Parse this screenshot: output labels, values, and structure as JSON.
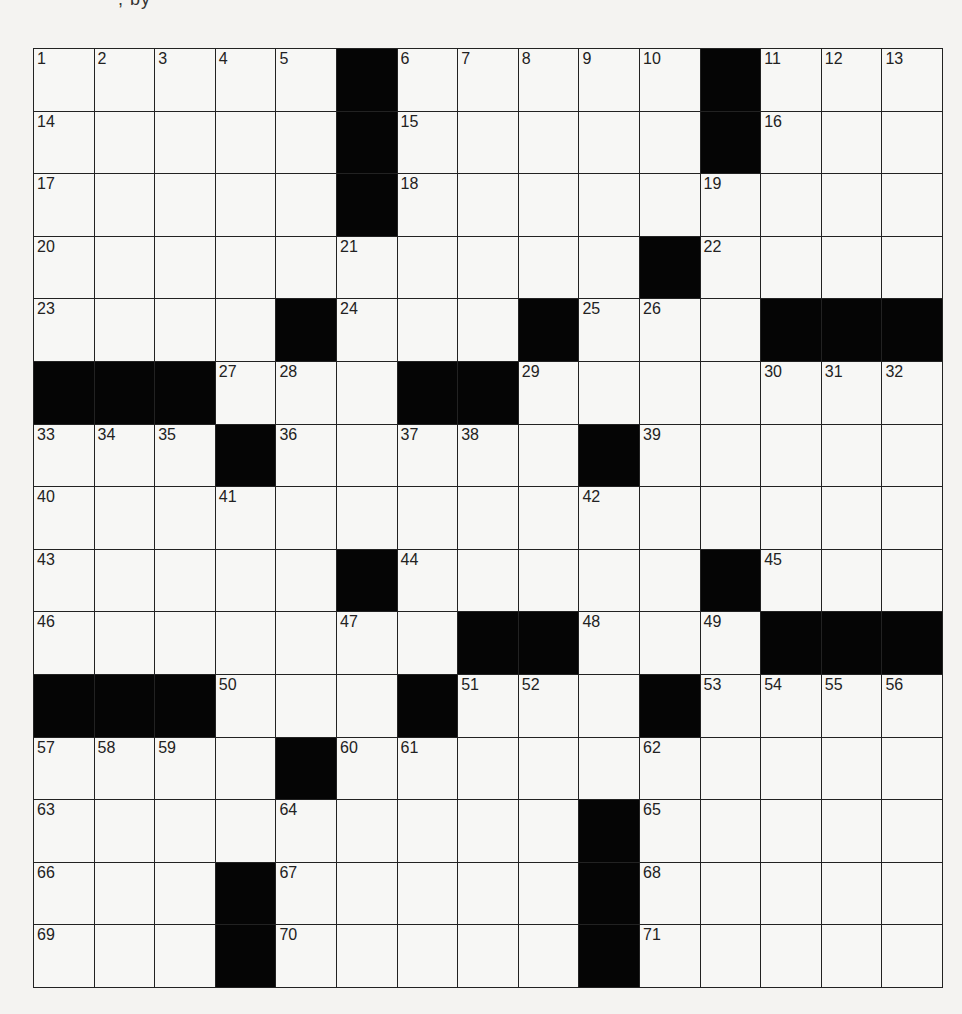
{
  "header": {
    "fragment": ", by"
  },
  "puzzle": {
    "rows": 15,
    "cols": 15,
    "colors": {
      "black": "#050505",
      "white": "#f7f7f5",
      "line": "#222222"
    },
    "grid": [
      [
        "1",
        "2",
        "3",
        "4",
        "5",
        "#",
        "6",
        "7",
        "8",
        "9",
        "10",
        "#",
        "11",
        "12",
        "13"
      ],
      [
        "14",
        "",
        "",
        "",
        "",
        "#",
        "15",
        "",
        "",
        "",
        "",
        "#",
        "16",
        "",
        ""
      ],
      [
        "17",
        "",
        "",
        "",
        "",
        "#",
        "18",
        "",
        "",
        "",
        "",
        "19",
        "",
        "",
        ""
      ],
      [
        "20",
        "",
        "",
        "",
        "",
        "21",
        "",
        "",
        "",
        "",
        "#",
        "22",
        "",
        "",
        ""
      ],
      [
        "23",
        "",
        "",
        "",
        "#",
        "24",
        "",
        "",
        "#",
        "25",
        "26",
        "",
        "#",
        "#",
        "#"
      ],
      [
        "#",
        "#",
        "#",
        "27",
        "28",
        "",
        "#",
        "#",
        "29",
        "",
        "",
        "",
        "30",
        "31",
        "32"
      ],
      [
        "33",
        "34",
        "35",
        "#",
        "36",
        "",
        "37",
        "38",
        "",
        "#",
        "39",
        "",
        "",
        "",
        ""
      ],
      [
        "40",
        "",
        "",
        "41",
        "",
        "",
        "",
        "",
        "",
        "42",
        "",
        "",
        "",
        "",
        ""
      ],
      [
        "43",
        "",
        "",
        "",
        "",
        "#",
        "44",
        "",
        "",
        "",
        "",
        "#",
        "45",
        "",
        ""
      ],
      [
        "46",
        "",
        "",
        "",
        "",
        "47",
        "",
        "#",
        "#",
        "48",
        "",
        "49",
        "#",
        "#",
        "#"
      ],
      [
        "#",
        "#",
        "#",
        "50",
        "",
        "",
        "#",
        "51",
        "52",
        "",
        "#",
        "53",
        "54",
        "55",
        "56"
      ],
      [
        "57",
        "58",
        "59",
        "",
        "#",
        "60",
        "61",
        "",
        "",
        "",
        "62",
        "",
        "",
        "",
        ""
      ],
      [
        "63",
        "",
        "",
        "",
        "64",
        "",
        "",
        "",
        "",
        "#",
        "65",
        "",
        "",
        "",
        ""
      ],
      [
        "66",
        "",
        "",
        "#",
        "67",
        "",
        "",
        "",
        "",
        "#",
        "68",
        "",
        "",
        "",
        ""
      ],
      [
        "69",
        "",
        "",
        "#",
        "70",
        "",
        "",
        "",
        "",
        "#",
        "71",
        "",
        "",
        "",
        ""
      ]
    ]
  }
}
